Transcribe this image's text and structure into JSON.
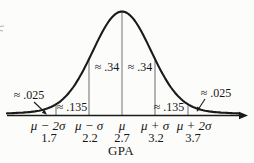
{
  "chart_data": {
    "type": "area",
    "curve": "normal-distribution-bell-curve",
    "xlabel": "GPA",
    "mean": 2.7,
    "standard_deviation": 0.5,
    "x_ticks": [
      {
        "symbol": "μ − 2σ",
        "value": "1.7"
      },
      {
        "symbol": "μ − σ",
        "value": "2.2"
      },
      {
        "symbol": "μ",
        "value": "2.7"
      },
      {
        "symbol": "μ + σ",
        "value": "3.2"
      },
      {
        "symbol": "μ + 2σ",
        "value": "3.7"
      }
    ],
    "areas": [
      {
        "region": "left tail below μ−2σ",
        "proportion": 0.025,
        "label": "≈ .025"
      },
      {
        "region": "μ−2σ to μ−σ",
        "proportion": 0.135,
        "label": "≈ .135"
      },
      {
        "region": "μ−σ to μ",
        "proportion": 0.34,
        "label": "≈ .34"
      },
      {
        "region": "μ to μ+σ",
        "proportion": 0.34,
        "label": "≈ .34"
      },
      {
        "region": "μ+σ to μ+2σ",
        "proportion": 0.135,
        "label": "≈ .135"
      },
      {
        "region": "right tail above μ+2σ",
        "proportion": 0.025,
        "label": "≈ .025"
      }
    ],
    "colors": {
      "curve": "#1a1a1a",
      "axis": "#1a1a1a",
      "sigma_lines": "#777777",
      "text": "#161616"
    }
  }
}
